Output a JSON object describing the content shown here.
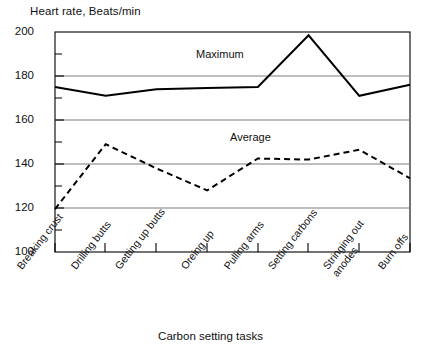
{
  "chart_data": {
    "type": "line",
    "title": "",
    "ylabel": "Heart rate, Beats/min",
    "xlabel": "Carbon setting tasks",
    "ylim": [
      100,
      200
    ],
    "y_ticks": [
      100,
      120,
      140,
      160,
      180,
      200
    ],
    "y_minor_tick_step": 10,
    "grid": "horizontal-major",
    "legend": "in-plot-labels",
    "categories": [
      "Breaking crust",
      "Drilling butts",
      "Getting up butts",
      "Oreing up",
      "Pulling arms",
      "Setting carbons",
      "Stringing out anodes",
      "Burn offs"
    ],
    "series": [
      {
        "name": "Maximum",
        "style": "solid",
        "color": "#000000",
        "values": [
          175,
          171,
          174,
          174.5,
          175,
          198.5,
          171,
          176
        ]
      },
      {
        "name": "Average",
        "style": "dashed",
        "color": "#000000",
        "values": [
          119.5,
          149,
          138,
          128,
          142.5,
          142,
          146.5,
          133.5
        ]
      }
    ],
    "annotations": [
      {
        "text": "Maximum",
        "x_category": "Oreing up",
        "y": 186
      },
      {
        "text": "Average",
        "x_category": "Pulling arms",
        "y": 152
      }
    ]
  },
  "axis": {
    "y_labels": [
      "200",
      "180",
      "160",
      "140",
      "120",
      "100"
    ],
    "x_labels": [
      {
        "text": "Breaking crust",
        "lines": [
          "Breaking crust"
        ]
      },
      {
        "text": "Drilling butts",
        "lines": [
          "Drilling butts"
        ]
      },
      {
        "text": "Getting up butts",
        "lines": [
          "Getting up butts"
        ]
      },
      {
        "text": "Oreing up",
        "lines": [
          "Oreing up"
        ]
      },
      {
        "text": "Pulling arms",
        "lines": [
          "Pulling arms"
        ]
      },
      {
        "text": "Setting carbons",
        "lines": [
          "Setting carbons"
        ]
      },
      {
        "text": "Stringing out anodes",
        "lines": [
          "Stringing out",
          "anodes"
        ]
      },
      {
        "text": "Burn offs",
        "lines": [
          "Burn offs"
        ]
      }
    ]
  },
  "labels": {
    "y_axis_title": "Heart rate, Beats/min",
    "x_axis_title": "Carbon setting tasks",
    "maximum": "Maximum",
    "average": "Average",
    "y_200": "200",
    "y_180": "180",
    "y_160": "160",
    "y_140": "140",
    "y_120": "120",
    "y_100": "100",
    "x_0": "Breaking crust",
    "x_1": "Drilling butts",
    "x_2": "Getting up butts",
    "x_3": "Oreing up",
    "x_4": "Pulling arms",
    "x_5": "Setting carbons",
    "x_6a": "Stringing out",
    "x_6b": "anodes",
    "x_7": "Burn offs"
  }
}
